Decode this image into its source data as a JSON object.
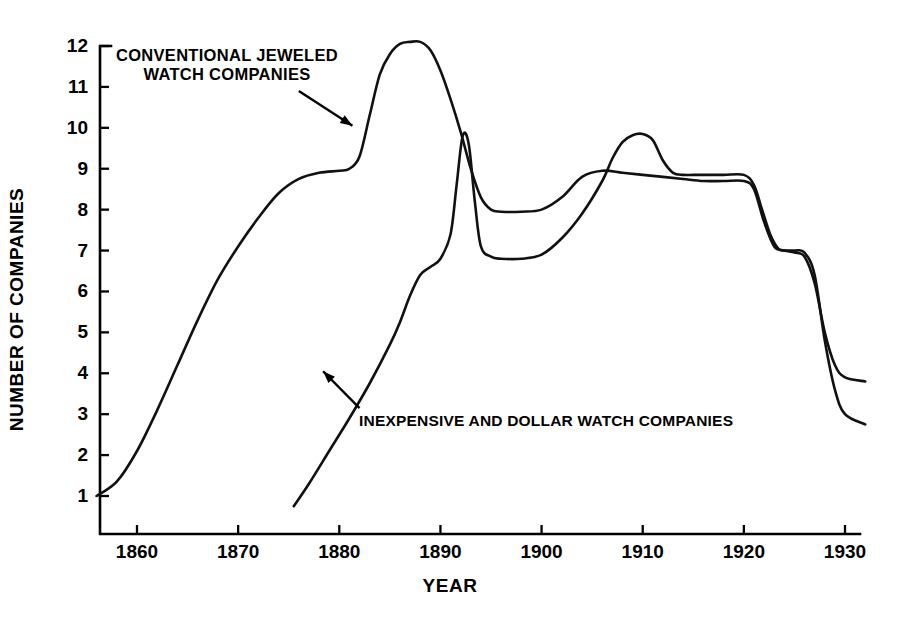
{
  "chart_data": {
    "type": "line",
    "title": "",
    "xlabel": "YEAR",
    "ylabel": "NUMBER OF COMPANIES",
    "xlim": [
      1856,
      1932
    ],
    "ylim": [
      0,
      12.4
    ],
    "grid": false,
    "legend_position": "inline-annotations",
    "xticks": [
      1860,
      1870,
      1880,
      1890,
      1900,
      1910,
      1920,
      1930
    ],
    "xtick_labels": [
      "1860",
      "1870",
      "1880",
      "1890",
      "1900",
      "1910",
      "1920",
      "1930"
    ],
    "yticks": [
      1,
      2,
      3,
      4,
      5,
      6,
      7,
      8,
      9,
      10,
      11,
      12
    ],
    "ytick_labels": [
      "1",
      "2",
      "3",
      "4",
      "5",
      "6",
      "7",
      "8",
      "9",
      "10",
      "11",
      "12"
    ],
    "series": [
      {
        "name": "CONVENTIONAL JEWELED WATCH COMPANIES",
        "x": [
          1856,
          1858,
          1860,
          1862,
          1864,
          1866,
          1868,
          1870,
          1872,
          1874,
          1876,
          1878,
          1880,
          1881,
          1882,
          1883,
          1884,
          1885,
          1886,
          1887,
          1888,
          1889,
          1890,
          1891,
          1892,
          1893,
          1894,
          1895,
          1896,
          1898,
          1900,
          1902,
          1904,
          1906,
          1908,
          1910,
          1912,
          1914,
          1916,
          1918,
          1920,
          1921,
          1922,
          1923,
          1924,
          1925,
          1926,
          1927,
          1928,
          1929,
          1930,
          1932
        ],
        "y": [
          1.0,
          1.35,
          2.1,
          3.1,
          4.2,
          5.3,
          6.3,
          7.1,
          7.8,
          8.4,
          8.75,
          8.9,
          8.95,
          9.0,
          9.3,
          10.3,
          11.3,
          11.8,
          12.05,
          12.1,
          12.1,
          11.9,
          11.4,
          10.7,
          9.9,
          9.0,
          8.3,
          8.0,
          7.95,
          7.95,
          8.0,
          8.3,
          8.8,
          8.95,
          8.9,
          8.85,
          8.8,
          8.75,
          8.7,
          8.7,
          8.7,
          8.5,
          7.7,
          7.1,
          7.0,
          6.95,
          6.85,
          6.2,
          5.0,
          4.2,
          3.9,
          3.8
        ]
      },
      {
        "name": "INEXPENSIVE AND DOLLAR WATCH COMPANIES",
        "x": [
          1875.5,
          1877,
          1879,
          1881,
          1883,
          1885,
          1886,
          1887,
          1888,
          1889,
          1890,
          1891,
          1891.6,
          1892.2,
          1892.8,
          1893.4,
          1894,
          1895,
          1896,
          1898,
          1900,
          1902,
          1904,
          1906,
          1907,
          1908,
          1909,
          1910,
          1911,
          1912,
          1913,
          1914,
          1915,
          1916,
          1918,
          1920,
          1921,
          1921.8,
          1922.6,
          1923.4,
          1924,
          1925,
          1926,
          1927,
          1928,
          1929,
          1930,
          1932
        ],
        "y": [
          0.75,
          1.3,
          2.1,
          2.9,
          3.75,
          4.7,
          5.25,
          5.9,
          6.4,
          6.6,
          6.8,
          7.4,
          8.6,
          9.8,
          9.6,
          8.2,
          7.1,
          6.85,
          6.8,
          6.8,
          6.9,
          7.3,
          7.9,
          8.7,
          9.25,
          9.65,
          9.82,
          9.85,
          9.7,
          9.2,
          8.9,
          8.85,
          8.85,
          8.85,
          8.85,
          8.85,
          8.6,
          8.0,
          7.4,
          7.05,
          7.0,
          7.0,
          6.95,
          6.4,
          4.8,
          3.6,
          3.0,
          2.75
        ]
      }
    ],
    "annotations": [
      {
        "name": "jeweled-label",
        "lines": [
          "CONVENTIONAL JEWELED",
          "WATCH COMPANIES"
        ],
        "text": "CONVENTIONAL JEWELED\nWATCH COMPANIES",
        "arrow_from": [
          1876.0,
          10.9
        ],
        "arrow_to": [
          1881.3,
          10.05
        ]
      },
      {
        "name": "dollar-label",
        "lines": [
          "INEXPENSIVE AND DOLLAR WATCH COMPANIES"
        ],
        "text": "INEXPENSIVE AND DOLLAR WATCH COMPANIES",
        "arrow_from": [
          1882.0,
          3.15
        ],
        "arrow_to": [
          1878.4,
          4.05
        ]
      }
    ]
  },
  "style": {
    "line_color": "#111111",
    "axis_color": "#000000",
    "background": "#ffffff",
    "line_width": 2.6,
    "axis_width": 2.6
  }
}
